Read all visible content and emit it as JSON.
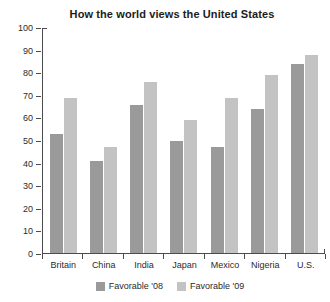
{
  "chart_data": {
    "type": "bar",
    "title": "How the world views the United States",
    "xlabel": "",
    "ylabel": "",
    "ylim": [
      0,
      100
    ],
    "yticks": [
      0,
      10,
      20,
      30,
      40,
      50,
      60,
      70,
      80,
      90,
      100
    ],
    "grid": false,
    "legend_position": "bottom",
    "categories": [
      "Britain",
      "China",
      "India",
      "Japan",
      "Mexico",
      "Nigeria",
      "U.S."
    ],
    "series": [
      {
        "name": "Favorable '08",
        "color": "#9a9a9a",
        "values": [
          53,
          41,
          66,
          50,
          47,
          64,
          84
        ]
      },
      {
        "name": "Favorable '09",
        "color": "#c3c3c3",
        "values": [
          69,
          47,
          76,
          59,
          69,
          79,
          88
        ]
      }
    ]
  }
}
